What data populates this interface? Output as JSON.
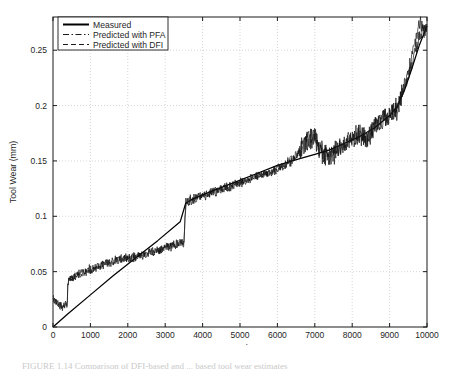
{
  "figure": {
    "caption_clipped": "FIGURE 1.14   Comparison of DFI-based and ... based tool wear estimates"
  },
  "chart_data": {
    "type": "line",
    "title": "",
    "xlabel": "Samples",
    "ylabel": "Tool Wear (mm)",
    "xlim": [
      0,
      10000
    ],
    "ylim": [
      0,
      0.28
    ],
    "xticks": [
      0,
      1000,
      2000,
      3000,
      4000,
      5000,
      6000,
      7000,
      8000,
      9000,
      10000
    ],
    "xticklabels": [
      "0",
      "1000",
      "2000",
      "3000",
      "4000",
      "5000",
      "6000",
      "7000",
      "8000",
      "9000",
      "10000"
    ],
    "yticks": [
      0,
      0.05,
      0.1,
      0.15,
      0.2,
      0.25
    ],
    "yticklabels": [
      "0",
      "0.05",
      "0.1",
      "0.15",
      "0.2",
      "0.25"
    ],
    "grid": true,
    "grid_style": "dotted",
    "grid_color": "#cccccc",
    "legend": {
      "position": "upper-left",
      "entries": [
        {
          "name": "Measured",
          "style": "solid",
          "color": "#000000"
        },
        {
          "name": "Predicted with PFA",
          "style": "dashdot",
          "color": "#1a1a1a"
        },
        {
          "name": "Predicted with DFI",
          "style": "dashed",
          "color": "#1a1a1a"
        }
      ]
    },
    "series": [
      {
        "name": "Measured",
        "style": "solid",
        "color": "#000000",
        "comment": "Piecewise-linear ground-truth wear curve rising from 0 with a step at ~3550 samples",
        "x": [
          0,
          400,
          1000,
          1600,
          2200,
          2800,
          3400,
          3550,
          3700,
          4200,
          4800,
          5400,
          6000,
          6600,
          7000,
          7400,
          7800,
          8200,
          8600,
          9000,
          9200,
          9400,
          9600,
          9800,
          10000
        ],
        "y": [
          0.0,
          0.012,
          0.029,
          0.046,
          0.062,
          0.078,
          0.095,
          0.112,
          0.115,
          0.122,
          0.13,
          0.138,
          0.146,
          0.152,
          0.156,
          0.16,
          0.166,
          0.172,
          0.18,
          0.191,
          0.199,
          0.214,
          0.234,
          0.255,
          0.272
        ]
      },
      {
        "name": "Predicted with PFA",
        "style": "dashdot",
        "color": "#111111",
        "comment": "Noisy estimate tracking measured wear; dips near sample 250, steps up at 400 and 3550",
        "x": [
          0,
          100,
          200,
          250,
          300,
          380,
          400,
          500,
          700,
          900,
          1100,
          1300,
          1500,
          1700,
          1900,
          2100,
          2300,
          2500,
          2700,
          2900,
          3100,
          3300,
          3500,
          3550,
          3700,
          3900,
          4100,
          4300,
          4500,
          4700,
          4900,
          5100,
          5300,
          5500,
          5700,
          5900,
          6100,
          6300,
          6500,
          6700,
          6900,
          7000,
          7200,
          7400,
          7600,
          7800,
          8000,
          8200,
          8400,
          8600,
          8800,
          9000,
          9200,
          9400,
          9600,
          9800,
          10000
        ],
        "y": [
          0.026,
          0.023,
          0.019,
          0.018,
          0.019,
          0.021,
          0.042,
          0.044,
          0.047,
          0.05,
          0.053,
          0.056,
          0.058,
          0.06,
          0.061,
          0.062,
          0.064,
          0.066,
          0.068,
          0.07,
          0.072,
          0.074,
          0.077,
          0.112,
          0.114,
          0.117,
          0.119,
          0.121,
          0.124,
          0.126,
          0.129,
          0.131,
          0.133,
          0.136,
          0.138,
          0.141,
          0.144,
          0.148,
          0.153,
          0.163,
          0.17,
          0.171,
          0.157,
          0.152,
          0.159,
          0.166,
          0.17,
          0.176,
          0.167,
          0.18,
          0.186,
          0.192,
          0.197,
          0.215,
          0.238,
          0.262,
          0.27
        ]
      },
      {
        "name": "Predicted with DFI",
        "style": "dashed",
        "color": "#111111",
        "comment": "Second noisy estimate, nearly coincident with PFA, diverging slightly after 9000",
        "x": [
          0,
          100,
          200,
          250,
          300,
          380,
          400,
          500,
          700,
          900,
          1100,
          1300,
          1500,
          1700,
          1900,
          2100,
          2300,
          2500,
          2700,
          2900,
          3100,
          3300,
          3500,
          3550,
          3700,
          3900,
          4100,
          4300,
          4500,
          4700,
          4900,
          5100,
          5300,
          5500,
          5700,
          5900,
          6100,
          6300,
          6500,
          6700,
          6900,
          7000,
          7200,
          7400,
          7600,
          7800,
          8000,
          8200,
          8400,
          8600,
          8800,
          9000,
          9200,
          9400,
          9600,
          9800,
          10000
        ],
        "y": [
          0.025,
          0.022,
          0.02,
          0.018,
          0.02,
          0.022,
          0.041,
          0.045,
          0.048,
          0.051,
          0.054,
          0.055,
          0.059,
          0.061,
          0.062,
          0.063,
          0.065,
          0.067,
          0.069,
          0.071,
          0.073,
          0.075,
          0.076,
          0.113,
          0.116,
          0.118,
          0.12,
          0.123,
          0.125,
          0.127,
          0.13,
          0.132,
          0.135,
          0.137,
          0.139,
          0.142,
          0.146,
          0.15,
          0.155,
          0.165,
          0.172,
          0.169,
          0.155,
          0.154,
          0.161,
          0.164,
          0.172,
          0.174,
          0.169,
          0.182,
          0.188,
          0.19,
          0.201,
          0.22,
          0.243,
          0.275,
          0.265
        ]
      }
    ]
  }
}
